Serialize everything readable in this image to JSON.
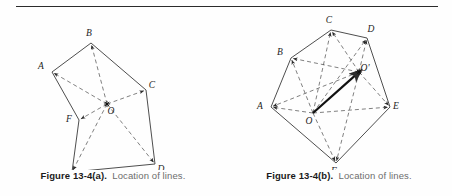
{
  "page": {
    "background_color": "#fefefe",
    "rule_color": "#2b2b2b"
  },
  "figures": [
    {
      "id": "figure-13-4a",
      "caption_label": "Figure 13-4(a).",
      "caption_text": "Location of lines.",
      "vertex_labels": [
        "A",
        "B",
        "C",
        "D",
        "E",
        "F",
        "O"
      ],
      "center_label": "O",
      "solid_color": "#3a3a3a",
      "dashed_color": "#555555"
    },
    {
      "id": "figure-13-4b",
      "caption_label": "Figure 13-4(b).",
      "caption_text": "Location of lines.",
      "vertex_labels": [
        "A",
        "B",
        "C",
        "D",
        "E",
        "F",
        "O",
        "O'"
      ],
      "center_label": "O",
      "center_prime_label": "O'",
      "solid_color": "#3a3a3a",
      "dashed_color": "#555555",
      "vector_color": "#111111"
    }
  ],
  "chart_data": {
    "type": "diagram",
    "panels": [
      {
        "name": "a",
        "caption_label": "Figure 13-4(a).",
        "caption_text": "Location of lines.",
        "description": "Irregular hexagon ABCDEF with interior point O joined by dashed rays to every vertex.",
        "points": {
          "A": [
            52,
            62
          ],
          "B": [
            91,
            33
          ],
          "C": [
            146,
            80
          ],
          "D": [
            155,
            154
          ],
          "E": [
            72,
            162
          ],
          "F": [
            79,
            110
          ],
          "O": [
            107,
            94
          ]
        },
        "label_offsets": {
          "A": [
            -11,
            -3
          ],
          "B": [
            -2,
            -7
          ],
          "C": [
            6,
            -2
          ],
          "D": [
            6,
            8
          ],
          "E": [
            -4,
            11
          ],
          "F": [
            -10,
            2
          ],
          "O": [
            4,
            10
          ]
        },
        "solid_edges": [
          [
            "A",
            "B"
          ],
          [
            "B",
            "C"
          ],
          [
            "C",
            "D"
          ],
          [
            "D",
            "E"
          ],
          [
            "E",
            "F"
          ],
          [
            "F",
            "A"
          ]
        ],
        "dashed_edges": [
          [
            "O",
            "A"
          ],
          [
            "O",
            "B"
          ],
          [
            "O",
            "C"
          ],
          [
            "O",
            "D"
          ],
          [
            "O",
            "E"
          ],
          [
            "O",
            "F"
          ]
        ],
        "arrow_endpoints": [
          "A",
          "B",
          "C",
          "D",
          "E",
          "F"
        ],
        "markers": [
          {
            "at": "O",
            "type": "star"
          }
        ]
      },
      {
        "name": "b",
        "caption_label": "Figure 13-4(b).",
        "caption_text": "Location of lines.",
        "description": "Hexagon ABCDEF with interior point O and displaced point O-prime; dashed rays from both points to all vertices and a bold vector from O to O-prime.",
        "points": {
          "A": [
            45,
            97
          ],
          "B": [
            65,
            48
          ],
          "C": [
            105,
            20
          ],
          "D": [
            141,
            28
          ],
          "E": [
            164,
            97
          ],
          "F": [
            110,
            153
          ],
          "O": [
            87,
            103
          ],
          "Op": [
            133,
            62
          ]
        },
        "label_offsets": {
          "A": [
            -11,
            2
          ],
          "B": [
            -11,
            -3
          ],
          "C": [
            -2,
            -7
          ],
          "D": [
            4,
            -6
          ],
          "E": [
            6,
            2
          ],
          "F": [
            -2,
            11
          ],
          "O": [
            -4,
            11
          ],
          "Op": [
            6,
            -1
          ]
        },
        "solid_edges": [
          [
            "A",
            "B"
          ],
          [
            "B",
            "C"
          ],
          [
            "C",
            "D"
          ],
          [
            "D",
            "E"
          ],
          [
            "E",
            "F"
          ],
          [
            "F",
            "A"
          ]
        ],
        "dashed_edges": [
          [
            "O",
            "A"
          ],
          [
            "O",
            "B"
          ],
          [
            "O",
            "C"
          ],
          [
            "O",
            "D"
          ],
          [
            "O",
            "E"
          ],
          [
            "O",
            "F"
          ],
          [
            "Op",
            "A"
          ],
          [
            "Op",
            "B"
          ],
          [
            "Op",
            "C"
          ],
          [
            "Op",
            "D"
          ],
          [
            "Op",
            "E"
          ],
          [
            "Op",
            "F"
          ]
        ],
        "vector": {
          "from": "O",
          "to": "Op",
          "style": "bold-arrow"
        },
        "arrow_endpoints": [
          "A",
          "B",
          "C",
          "D",
          "E",
          "F"
        ],
        "markers": [
          {
            "at": "Op",
            "type": "star"
          }
        ]
      }
    ]
  }
}
